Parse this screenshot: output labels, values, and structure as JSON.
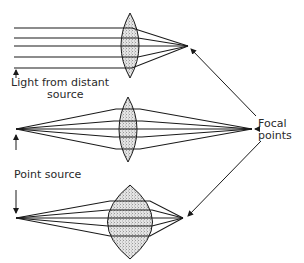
{
  "diagram": {
    "colors": {
      "ink": "#1a1a1a",
      "lens_fill": "#d9d9d9",
      "background": "#ffffff"
    },
    "panels": [
      {
        "id": "distant-source",
        "source_type": "parallel rays",
        "lens": "convex (thin)",
        "rays": 5
      },
      {
        "id": "point-source-near",
        "source_type": "point source",
        "lens": "convex (thin)",
        "rays": 5
      },
      {
        "id": "point-source-far",
        "source_type": "point source",
        "lens": "convex (thick)",
        "rays": 5
      }
    ],
    "labels": {
      "distant_line1": "Light from distant",
      "distant_line2": "source",
      "point_source": "Point source",
      "focal_line1": "Focal",
      "focal_line2": "points"
    }
  }
}
